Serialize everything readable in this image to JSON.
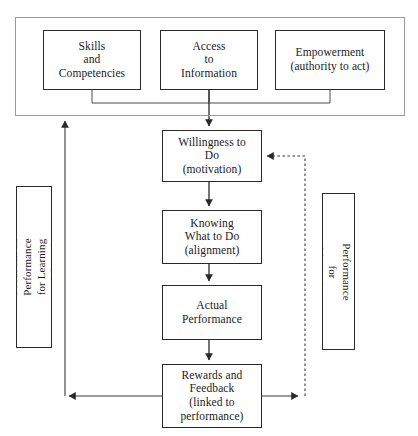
{
  "diagram": {
    "type": "flowchart",
    "colors": {
      "node_border": "#2a2a2a",
      "container_border": "#9a9a9a",
      "connector": "#3a3a3a",
      "background": "#ffffff"
    },
    "container": {
      "name": "enablers-container",
      "label": ""
    },
    "enabler_nodes": [
      {
        "id": "skills",
        "label": "Skills\nand\nCompetencies"
      },
      {
        "id": "access",
        "label": "Access\nto\nInformation"
      },
      {
        "id": "empowerment",
        "label": "Empowerment\n(authority to act)"
      }
    ],
    "flow_nodes": [
      {
        "id": "willingness",
        "label": "Willingness to\nDo\n(motivation)"
      },
      {
        "id": "knowing",
        "label": "Knowing\nWhat to Do\n(alignment)"
      },
      {
        "id": "actual",
        "label": "Actual\nPerformance"
      },
      {
        "id": "rewards",
        "label": "Rewards and\nFeedback\n(linked to\nperformance)"
      }
    ],
    "feedback_nodes": [
      {
        "id": "feedback-left",
        "label": "Feedback on Performance\nfor Learning and Growth",
        "orientation": "rotated-ccw"
      },
      {
        "id": "feedback-right",
        "label": "Feedback on Performance\nfor Motivation",
        "orientation": "rotated-cw"
      }
    ],
    "connectors": [
      {
        "id": "skills-to-bus",
        "from": "skills",
        "to": "bus",
        "style": "solid",
        "arrow": false
      },
      {
        "id": "access-to-bus",
        "from": "access",
        "to": "bus",
        "style": "solid",
        "arrow": false
      },
      {
        "id": "empowerment-to-bus",
        "from": "empowerment",
        "to": "bus",
        "style": "solid",
        "arrow": false
      },
      {
        "id": "bus-to-willingness",
        "from": "bus",
        "to": "willingness",
        "style": "solid",
        "arrow": true
      },
      {
        "id": "willingness-to-knowing",
        "from": "willingness",
        "to": "knowing",
        "style": "solid",
        "arrow": true
      },
      {
        "id": "knowing-to-actual",
        "from": "knowing",
        "to": "actual",
        "style": "solid",
        "arrow": true
      },
      {
        "id": "actual-to-rewards",
        "from": "actual",
        "to": "rewards",
        "style": "solid",
        "arrow": true
      },
      {
        "id": "rewards-to-left-loop",
        "from": "rewards",
        "to": "feedback-left",
        "style": "solid",
        "arrow": true
      },
      {
        "id": "left-loop-to-container",
        "from": "feedback-left",
        "to": "enablers-container",
        "style": "solid",
        "arrow": true
      },
      {
        "id": "rewards-to-right-loop",
        "from": "rewards",
        "to": "feedback-right",
        "style": "solid",
        "arrow": true
      },
      {
        "id": "right-loop-to-willingness",
        "from": "feedback-right",
        "to": "willingness",
        "style": "dotted",
        "arrow": true
      }
    ]
  }
}
